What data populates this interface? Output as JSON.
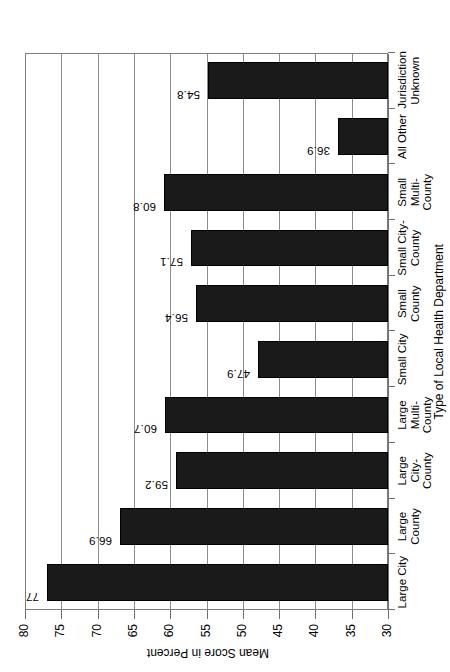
{
  "chart_data": {
    "type": "bar",
    "orientation": "horizontal",
    "rotated_page": true,
    "title": "",
    "xlabel": "Type of Local Health Department",
    "ylabel": "Mean Score in Percent",
    "ylim": [
      30,
      80
    ],
    "ytick_step": 5,
    "grid": true,
    "legend": "none",
    "bar_color": "#1a1a1a",
    "categories": [
      "Large City",
      "Large County",
      "Large City-County",
      "Large Multi-County",
      "Small City",
      "Small County",
      "Small City-County",
      "Small Multi-County",
      "All Other",
      "Jurisdiction Unknown"
    ],
    "category_labels_wrapped": [
      "Large City",
      "Large\nCounty",
      "Large City-\nCounty",
      "Large\nMulti-\nCounty",
      "Small City",
      "Small\nCounty",
      "Small City-\nCounty",
      "Small\nMulti-\nCounty",
      "All Other",
      "Jurisdiction\nUnknown"
    ],
    "values": [
      77,
      66.9,
      59.2,
      60.7,
      47.9,
      56.4,
      57.1,
      60.8,
      36.9,
      54.8
    ],
    "value_labels": [
      "77",
      "66.9",
      "59.2",
      "60.7",
      "47.9",
      "56.4",
      "57.1",
      "60.8",
      "36.9",
      "54.8"
    ],
    "yticks": [
      30,
      35,
      40,
      45,
      50,
      55,
      60,
      65,
      70,
      75,
      80
    ],
    "ytick_labels": [
      "30",
      "35",
      "40",
      "45",
      "50",
      "55",
      "60",
      "65",
      "70",
      "75",
      "80"
    ]
  }
}
